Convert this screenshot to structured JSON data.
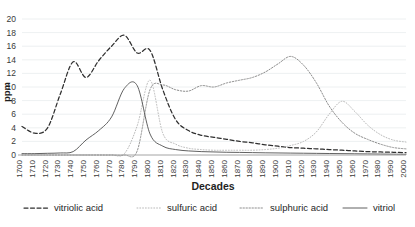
{
  "chart_data": {
    "type": "line",
    "title": "",
    "xlabel": "Decades",
    "ylabel": "ppm",
    "grid": true,
    "legend_position": "bottom",
    "xlim": [
      1700,
      2000
    ],
    "ylim": [
      0,
      20
    ],
    "y_ticks": [
      0,
      2,
      4,
      6,
      8,
      10,
      12,
      14,
      16,
      18,
      20
    ],
    "x": [
      1700,
      1710,
      1720,
      1730,
      1740,
      1750,
      1760,
      1770,
      1780,
      1790,
      1800,
      1810,
      1820,
      1830,
      1840,
      1850,
      1860,
      1870,
      1880,
      1890,
      1900,
      1910,
      1920,
      1930,
      1940,
      1950,
      1960,
      1970,
      1980,
      1990,
      2000
    ],
    "categories": [
      "1700",
      "1710",
      "1720",
      "1730",
      "1740",
      "1750",
      "1760",
      "1770",
      "1780",
      "1790",
      "1800",
      "1810",
      "1820",
      "1830",
      "1840",
      "1850",
      "1860",
      "1870",
      "1880",
      "1890",
      "1900",
      "1910",
      "1920",
      "1930",
      "1940",
      "1950",
      "1960",
      "1970",
      "1980",
      "1990",
      "2000"
    ],
    "series": [
      {
        "name": "vitriolic acid",
        "style": "dashed",
        "color": "#2f2f2f",
        "values": [
          4.2,
          3.2,
          4.0,
          9.0,
          13.7,
          11.4,
          13.9,
          16.0,
          17.6,
          15.0,
          15.4,
          9.6,
          5.2,
          3.6,
          2.9,
          2.6,
          2.3,
          2.0,
          1.8,
          1.5,
          1.3,
          1.1,
          1.0,
          0.9,
          0.8,
          0.7,
          0.6,
          0.5,
          0.45,
          0.4,
          0.35
        ]
      },
      {
        "name": "sulfuric acid",
        "style": "fine-dotted",
        "color": "#b9b9b9",
        "values": [
          0.0,
          0.0,
          0.0,
          0.0,
          0.0,
          0.0,
          0.0,
          0.0,
          0.2,
          4.3,
          11.0,
          3.2,
          1.6,
          1.0,
          0.8,
          0.7,
          0.7,
          0.7,
          0.7,
          0.8,
          1.0,
          1.4,
          2.0,
          3.4,
          6.0,
          7.9,
          6.4,
          4.4,
          3.0,
          2.2,
          1.9
        ]
      },
      {
        "name": "sulphuric acid",
        "style": "dotted",
        "color": "#8d8d8d",
        "values": [
          0.0,
          0.0,
          0.0,
          0.0,
          0.0,
          0.0,
          0.0,
          0.0,
          0.0,
          0.6,
          9.6,
          10.3,
          9.6,
          9.4,
          10.2,
          10.0,
          10.6,
          11.0,
          11.4,
          12.2,
          13.4,
          14.5,
          13.2,
          10.6,
          7.2,
          4.8,
          3.2,
          2.3,
          1.6,
          1.1,
          0.9
        ]
      },
      {
        "name": "vitriol",
        "style": "solid",
        "color": "#4f4f4f",
        "values": [
          0.2,
          0.2,
          0.25,
          0.3,
          0.5,
          2.2,
          3.6,
          5.6,
          9.8,
          10.2,
          3.1,
          1.3,
          0.8,
          0.6,
          0.5,
          0.45,
          0.4,
          0.38,
          0.35,
          0.32,
          0.3,
          0.28,
          0.26,
          0.24,
          0.22,
          0.2,
          0.18,
          0.16,
          0.14,
          0.12,
          0.1
        ]
      }
    ]
  },
  "axes": {
    "y_title": "ppm",
    "x_title": "Decades"
  },
  "legend": {
    "items": [
      {
        "label": "vitriolic acid",
        "swatch": "dashed-line-swatch"
      },
      {
        "label": "sulfuric acid",
        "swatch": "fine-dotted-line-swatch"
      },
      {
        "label": "sulphuric acid",
        "swatch": "dotted-line-swatch"
      },
      {
        "label": "vitriol",
        "swatch": "solid-line-swatch"
      }
    ]
  },
  "ticks": {
    "y": [
      "0",
      "2",
      "4",
      "6",
      "8",
      "10",
      "12",
      "14",
      "16",
      "18",
      "20"
    ],
    "x": [
      "1700",
      "1710",
      "1720",
      "1730",
      "1740",
      "1750",
      "1760",
      "1770",
      "1780",
      "1790",
      "1800",
      "1810",
      "1820",
      "1830",
      "1840",
      "1850",
      "1860",
      "1870",
      "1880",
      "1890",
      "1900",
      "1910",
      "1920",
      "1930",
      "1940",
      "1950",
      "1960",
      "1970",
      "1980",
      "1990",
      "2000"
    ]
  }
}
